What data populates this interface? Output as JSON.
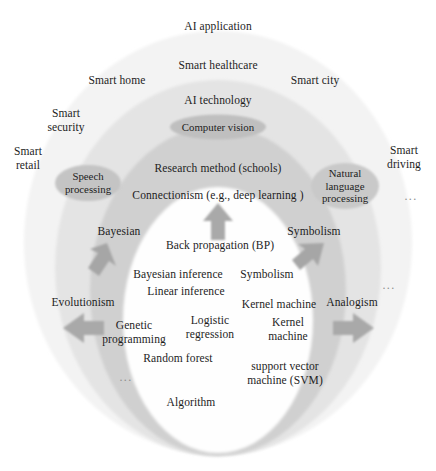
{
  "figure": {
    "type": "concentric-layer-diagram"
  },
  "layers": [
    {
      "id": "ai-application",
      "label": "AI application",
      "fill": "#f2f2f2"
    },
    {
      "id": "ai-technology",
      "label": "AI technology",
      "fill": "#e2e2e2"
    },
    {
      "id": "research-method",
      "label": "Research method (schools)",
      "fill": "#cfcfcf"
    },
    {
      "id": "algorithm",
      "label": "Algorithm",
      "fill": "#ffffff"
    }
  ],
  "application_layer": {
    "heading": "AI application",
    "items": [
      {
        "label": "Smart healthcare"
      },
      {
        "label": "Smart home"
      },
      {
        "label": "Smart city"
      },
      {
        "label": "Smart\nsecurity"
      },
      {
        "label": "Smart\nretail"
      },
      {
        "label": "Smart\ndriving"
      }
    ]
  },
  "technology_layer": {
    "heading": "AI technology",
    "pills": [
      {
        "label": "Computer vision"
      },
      {
        "label": "Speech\nprocessing"
      },
      {
        "label": "Natural\nlanguage\nprocessing"
      }
    ],
    "ellipsis": "..."
  },
  "research_layer": {
    "heading": "Research method (schools)",
    "subheading": "Connectionism (e.g., deep learning )",
    "schools": [
      {
        "label": "Bayesian"
      },
      {
        "label": "Symbolism"
      },
      {
        "label": "Evolutionism"
      },
      {
        "label": "Analogism"
      }
    ],
    "ellipsis": "..."
  },
  "algorithm_layer": {
    "heading": "Algorithm",
    "items": [
      {
        "label": "Back propagation (BP)"
      },
      {
        "label": "Bayesian inference"
      },
      {
        "label": "Symbolism"
      },
      {
        "label": "Linear inference"
      },
      {
        "label": "Kernel machine"
      },
      {
        "label": "Genetic\nprogramming"
      },
      {
        "label": "Logistic\nregression"
      },
      {
        "label": "Kernel\nmachine"
      },
      {
        "label": "Random forest"
      },
      {
        "label": "support vector\nmachine (SVM)"
      }
    ],
    "ellipsis": "..."
  },
  "arrows": [
    {
      "id": "arrow-up",
      "direction": "up"
    },
    {
      "id": "arrow-up-left",
      "direction": "up-left"
    },
    {
      "id": "arrow-up-right",
      "direction": "up-right"
    },
    {
      "id": "arrow-left",
      "direction": "left"
    },
    {
      "id": "arrow-right",
      "direction": "right"
    }
  ],
  "colors": {
    "ring_outer": "#f2f2f2",
    "ring_mid": "#e2e2e2",
    "ring_inner": "#cfcfcf",
    "core": "#ffffff",
    "pill": "#c0c0c0",
    "arrow": "#a8a8a8",
    "text": "#1d1d1d"
  }
}
